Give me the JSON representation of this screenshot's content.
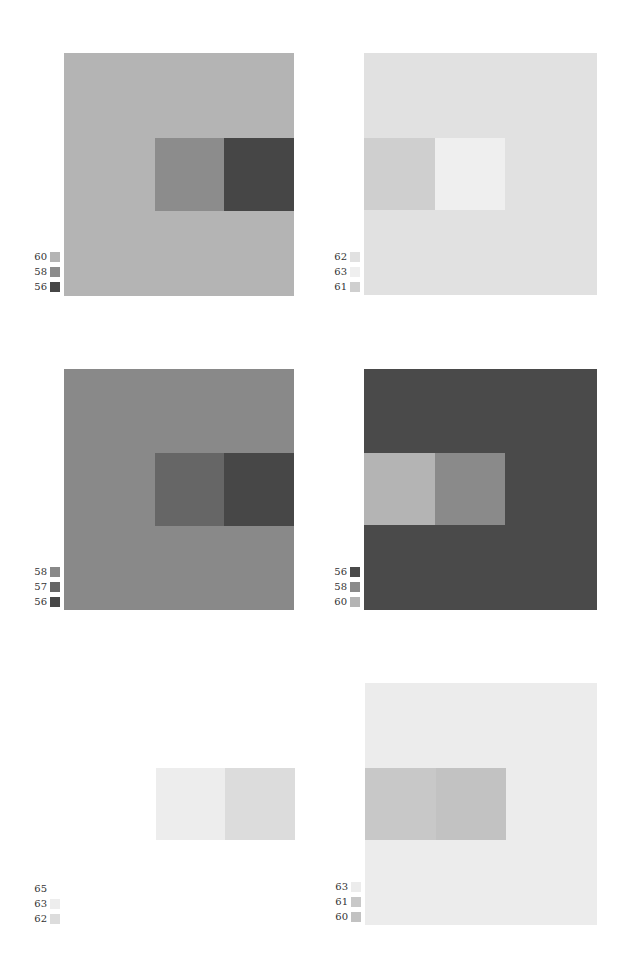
{
  "figures": [
    {
      "id": "p1",
      "box": {
        "x": 64,
        "y": 53,
        "w": 230,
        "h": 243
      },
      "background": "#b4b4b4",
      "inner": [
        {
          "x": 155,
          "y": 138,
          "w": 69,
          "h": 73,
          "color": "#8c8c8c"
        },
        {
          "x": 224,
          "y": 138,
          "w": 70,
          "h": 73,
          "color": "#464646"
        }
      ],
      "legend": {
        "x": 24,
        "y": 252,
        "items": [
          {
            "label": "60",
            "color": "#b4b4b4"
          },
          {
            "label": "58",
            "color": "#8c8c8c"
          },
          {
            "label": "56",
            "color": "#464646"
          }
        ]
      }
    },
    {
      "id": "p2",
      "box": {
        "x": 364,
        "y": 53,
        "w": 233,
        "h": 242
      },
      "background": "#e1e1e1",
      "inner": [
        {
          "x": 364,
          "y": 138,
          "w": 71,
          "h": 72,
          "color": "#cfcfcf"
        },
        {
          "x": 435,
          "y": 138,
          "w": 70,
          "h": 72,
          "color": "#efefef"
        }
      ],
      "legend": {
        "x": 324,
        "y": 252,
        "items": [
          {
            "label": "62",
            "color": "#e1e1e1"
          },
          {
            "label": "63",
            "color": "#efefef"
          },
          {
            "label": "61",
            "color": "#cfcfcf"
          }
        ]
      }
    },
    {
      "id": "p3",
      "box": {
        "x": 64,
        "y": 369,
        "w": 230,
        "h": 241
      },
      "background": "#898989",
      "inner": [
        {
          "x": 155,
          "y": 453,
          "w": 69,
          "h": 73,
          "color": "#666666"
        },
        {
          "x": 224,
          "y": 453,
          "w": 70,
          "h": 73,
          "color": "#474747"
        }
      ],
      "legend": {
        "x": 24,
        "y": 567,
        "items": [
          {
            "label": "58",
            "color": "#898989"
          },
          {
            "label": "57",
            "color": "#666666"
          },
          {
            "label": "56",
            "color": "#474747"
          }
        ]
      }
    },
    {
      "id": "p4",
      "box": {
        "x": 364,
        "y": 369,
        "w": 233,
        "h": 241
      },
      "background": "#4a4a4a",
      "inner": [
        {
          "x": 364,
          "y": 453,
          "w": 71,
          "h": 72,
          "color": "#b4b4b4"
        },
        {
          "x": 435,
          "y": 453,
          "w": 70,
          "h": 72,
          "color": "#8a8a8a"
        }
      ],
      "legend": {
        "x": 324,
        "y": 567,
        "items": [
          {
            "label": "56",
            "color": "#4a4a4a"
          },
          {
            "label": "58",
            "color": "#8a8a8a"
          },
          {
            "label": "60",
            "color": "#b4b4b4"
          }
        ]
      }
    },
    {
      "id": "p5",
      "box": {
        "x": 64,
        "y": 684,
        "w": 230,
        "h": 241
      },
      "background": "#ffffff",
      "inner": [
        {
          "x": 156,
          "y": 768,
          "w": 69,
          "h": 72,
          "color": "#ededed"
        },
        {
          "x": 225,
          "y": 768,
          "w": 70,
          "h": 72,
          "color": "#dcdcdc"
        }
      ],
      "legend": {
        "x": 24,
        "y": 884,
        "items": [
          {
            "label": "65",
            "color": "#ffffff"
          },
          {
            "label": "63",
            "color": "#ededed"
          },
          {
            "label": "62",
            "color": "#dcdcdc"
          }
        ]
      }
    },
    {
      "id": "p6",
      "box": {
        "x": 365,
        "y": 683,
        "w": 232,
        "h": 242
      },
      "background": "#ececec",
      "inner": [
        {
          "x": 365,
          "y": 768,
          "w": 71,
          "h": 72,
          "color": "#c8c8c8"
        },
        {
          "x": 436,
          "y": 768,
          "w": 70,
          "h": 72,
          "color": "#c2c2c2"
        }
      ],
      "legend": {
        "x": 325,
        "y": 882,
        "items": [
          {
            "label": "63",
            "color": "#ececec"
          },
          {
            "label": "61",
            "color": "#c8c8c8"
          },
          {
            "label": "60",
            "color": "#c2c2c2"
          }
        ]
      }
    }
  ]
}
